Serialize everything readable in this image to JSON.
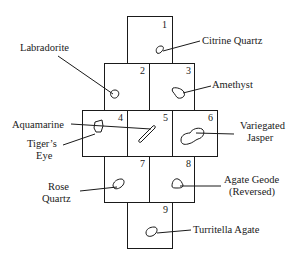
{
  "diagram": {
    "positions": [
      {
        "n": "1",
        "stone": "Citrine Quartz"
      },
      {
        "n": "2",
        "stone": "Labradorite"
      },
      {
        "n": "3",
        "stone": "Amethyst"
      },
      {
        "n": "4",
        "stone": "Tiger's Eye"
      },
      {
        "n": "5",
        "stone": "Aquamarine"
      },
      {
        "n": "6",
        "stone": "Variegated Jasper"
      },
      {
        "n": "7",
        "stone": "Rose Quartz"
      },
      {
        "n": "8",
        "stone": "Agate Geode (Reversed)"
      },
      {
        "n": "9",
        "stone": "Turritella Agate"
      }
    ],
    "labels": {
      "citrine": "Citrine  Quartz",
      "labradorite": "Labradorite",
      "amethyst": "Amethyst",
      "aquamarine": "Aquamarine",
      "variegated_1": "Variegated",
      "variegated_2": "Jasper",
      "tigers_1": "Tiger’s",
      "tigers_2": "Eye",
      "rose_1": "Rose",
      "rose_2": "Quartz",
      "agate_1": "Agate Geode",
      "agate_2": "(Reversed)",
      "turritella": "Turritella  Agate"
    },
    "colors": {
      "line": "#1a1a1a",
      "background": "#ffffff"
    }
  }
}
